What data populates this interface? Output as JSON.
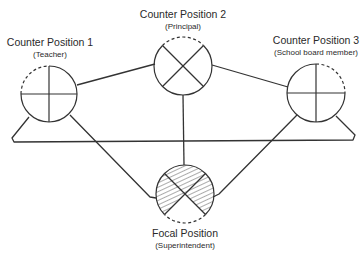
{
  "nodes": {
    "counter1": {
      "title": "Counter Position 1",
      "subtitle": "(Teacher)"
    },
    "counter2": {
      "title": "Counter Position 2",
      "subtitle": "(Principal)"
    },
    "counter3": {
      "title": "Counter Position 3",
      "subtitle": "(School board member)"
    },
    "focal": {
      "title": "Focal Position",
      "subtitle": "(Superintendent)"
    }
  },
  "colors": {
    "stroke": "#333333",
    "hatch": "#444444",
    "background": "#ffffff"
  }
}
